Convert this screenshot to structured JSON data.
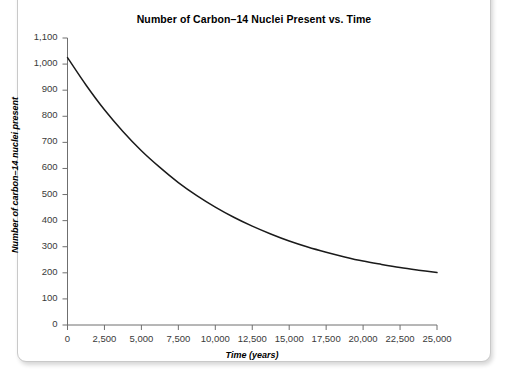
{
  "chart_data": {
    "type": "line",
    "title": "Number of Carbon–14 Nuclei Present vs. Time",
    "xlabel": "Time (years)",
    "ylabel": "Number of carbon–14 nuclei present",
    "xlim": [
      0,
      25000
    ],
    "ylim": [
      0,
      1100
    ],
    "grid": false,
    "legend": null,
    "xticks": [
      0,
      2500,
      5000,
      7500,
      10000,
      12500,
      15000,
      17500,
      20000,
      22500,
      25000
    ],
    "xticklabels": [
      "0",
      "2,500",
      "5,000",
      "7,500",
      "10,000",
      "12,500",
      "15,000",
      "17,500",
      "20,000",
      "22,500",
      "25,000"
    ],
    "yticks": [
      0,
      100,
      200,
      300,
      400,
      500,
      600,
      700,
      800,
      900,
      1000,
      1100
    ],
    "yticklabels": [
      "0",
      "100",
      "200",
      "300",
      "400",
      "500",
      "600",
      "700",
      "800",
      "900",
      "1,000",
      "1,100"
    ],
    "series": [
      {
        "name": "Carbon-14 nuclei",
        "color": "#1a1a1a",
        "x": [
          0,
          1250,
          2500,
          3750,
          5000,
          6250,
          7500,
          8750,
          10000,
          11250,
          12500,
          13750,
          15000,
          16250,
          17500,
          18750,
          20000,
          21250,
          22500,
          23750,
          25000
        ],
        "values": [
          1025,
          920,
          825,
          742,
          668,
          604,
          546,
          496,
          452,
          413,
          379,
          349,
          322,
          299,
          279,
          261,
          245,
          232,
          220,
          210,
          201
        ]
      }
    ]
  }
}
